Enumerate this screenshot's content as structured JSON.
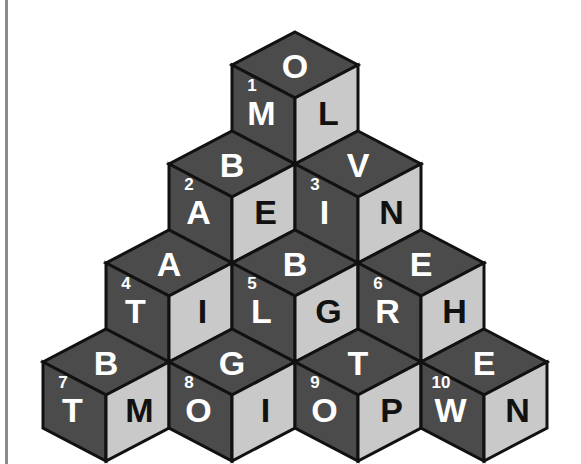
{
  "figure": {
    "type": "isometric-cube-pyramid-puzzle",
    "rows": 4,
    "cube_count": 10,
    "faces_per_cube": 3
  },
  "style": {
    "background": "#ffffff",
    "rule_color": "#8a8a8a",
    "face_top_color": "#4b4b4b",
    "face_left_color": "#4b4b4b",
    "face_right_color": "#c9c9c9",
    "edge_color": "#111111",
    "letter_light": "#ffffff",
    "letter_dark": "#111111"
  },
  "cubes": [
    {
      "number": "1",
      "row": 1,
      "col": 1,
      "origin_x": 295,
      "origin_y": 32,
      "top": {
        "letter": "O",
        "shade": "dark"
      },
      "left": {
        "letter": "M",
        "shade": "dark"
      },
      "right": {
        "letter": "L",
        "shade": "light"
      }
    },
    {
      "number": "2",
      "row": 2,
      "col": 1,
      "origin_x": 232,
      "origin_y": 131,
      "top": {
        "letter": "B",
        "shade": "dark"
      },
      "left": {
        "letter": "A",
        "shade": "dark"
      },
      "right": {
        "letter": "E",
        "shade": "light"
      }
    },
    {
      "number": "3",
      "row": 2,
      "col": 2,
      "origin_x": 358,
      "origin_y": 131,
      "top": {
        "letter": "V",
        "shade": "dark"
      },
      "left": {
        "letter": "I",
        "shade": "dark"
      },
      "right": {
        "letter": "N",
        "shade": "light"
      }
    },
    {
      "number": "4",
      "row": 3,
      "col": 1,
      "origin_x": 169,
      "origin_y": 230,
      "top": {
        "letter": "A",
        "shade": "dark"
      },
      "left": {
        "letter": "T",
        "shade": "dark"
      },
      "right": {
        "letter": "I",
        "shade": "light"
      }
    },
    {
      "number": "5",
      "row": 3,
      "col": 2,
      "origin_x": 295,
      "origin_y": 230,
      "top": {
        "letter": "B",
        "shade": "dark"
      },
      "left": {
        "letter": "L",
        "shade": "dark"
      },
      "right": {
        "letter": "G",
        "shade": "light"
      }
    },
    {
      "number": "6",
      "row": 3,
      "col": 3,
      "origin_x": 421,
      "origin_y": 230,
      "top": {
        "letter": "E",
        "shade": "dark"
      },
      "left": {
        "letter": "R",
        "shade": "dark"
      },
      "right": {
        "letter": "H",
        "shade": "light"
      }
    },
    {
      "number": "7",
      "row": 4,
      "col": 1,
      "origin_x": 106,
      "origin_y": 329,
      "top": {
        "letter": "B",
        "shade": "dark"
      },
      "left": {
        "letter": "T",
        "shade": "dark"
      },
      "right": {
        "letter": "M",
        "shade": "light"
      }
    },
    {
      "number": "8",
      "row": 4,
      "col": 2,
      "origin_x": 232,
      "origin_y": 329,
      "top": {
        "letter": "G",
        "shade": "dark"
      },
      "left": {
        "letter": "O",
        "shade": "dark"
      },
      "right": {
        "letter": "I",
        "shade": "light"
      }
    },
    {
      "number": "9",
      "row": 4,
      "col": 3,
      "origin_x": 358,
      "origin_y": 329,
      "top": {
        "letter": "T",
        "shade": "dark"
      },
      "left": {
        "letter": "O",
        "shade": "dark"
      },
      "right": {
        "letter": "P",
        "shade": "light"
      }
    },
    {
      "number": "10",
      "row": 4,
      "col": 4,
      "origin_x": 484,
      "origin_y": 329,
      "top": {
        "letter": "E",
        "shade": "dark"
      },
      "left": {
        "letter": "W",
        "shade": "dark"
      },
      "right": {
        "letter": "N",
        "shade": "light"
      }
    }
  ]
}
